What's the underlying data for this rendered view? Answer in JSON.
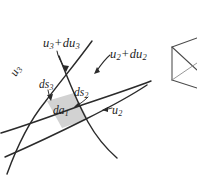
{
  "figure": {
    "name": "curvilinear-area-element",
    "width": 197,
    "height": 179,
    "background_color": "#ffffff",
    "stroke_color": "#2b2b2b",
    "patch_fill_color": "#d2d2d2",
    "patch_label": "da1"
  },
  "labels": {
    "u3_plus_du3": {
      "base": "u",
      "base_sub": "3",
      "operator": "+",
      "second": "du",
      "second_sub": "3",
      "text": "u3 + du3"
    },
    "u2_plus_du2": {
      "base": "u",
      "base_sub": "2",
      "operator": "+",
      "second": "du",
      "second_sub": "2",
      "text": "u2 + du2"
    },
    "u3": {
      "base": "u",
      "base_sub": "3",
      "text": "u3"
    },
    "u2": {
      "base": "u",
      "base_sub": "2",
      "text": "u2"
    },
    "ds3": {
      "base": "ds",
      "base_sub": "3",
      "text": "ds3"
    },
    "ds2": {
      "base": "ds",
      "base_sub": "2",
      "text": "ds2"
    },
    "da1": {
      "base": "da",
      "base_sub": "1",
      "text": "da1"
    }
  },
  "curves": {
    "u3_curve": "M 6,173 C 14,150 26,122 44,100 C 60,80 76,62 92,42",
    "u3_du3_curve": "M 60,58 C 68,78 76,100 88,122 C 98,140 108,150 116,157",
    "u2_curve": "M 2,134 C 24,126 52,116 82,106 C 112,96 136,88 150,82",
    "u2_du2_curve": "M 6,156 C 28,146 58,132 86,118 C 114,104 134,92 146,84"
  },
  "wedge": {
    "name": "partial-3d-wedge",
    "outline": "M 172,47 L 172,80 L 197,88 M 172,47 L 197,38 M 172,80 L 197,70",
    "inner": "M 172,63 L 197,56"
  }
}
